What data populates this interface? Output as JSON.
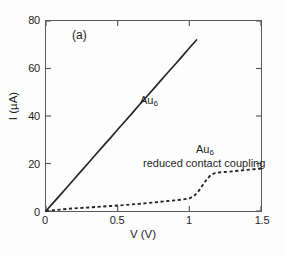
{
  "figure": {
    "panel_label": "(a)",
    "background_color": "#ffffff",
    "frame_color": "#5a5a5a"
  },
  "chart_data": {
    "type": "line",
    "title": "",
    "panel": "(a)",
    "xlabel": "V (V)",
    "ylabel": "I (µA)",
    "xlim": [
      0,
      1.5
    ],
    "ylim": [
      0,
      80
    ],
    "xticks": [
      0,
      0.5,
      1,
      1.5
    ],
    "xtick_labels": [
      "0",
      "0.5",
      "1",
      "1.5"
    ],
    "yticks": [
      0,
      20,
      40,
      60,
      80
    ],
    "ytick_labels": [
      "0",
      "20",
      "40",
      "60",
      "80"
    ],
    "grid": false,
    "tick_direction": "in",
    "legend": "none",
    "annotations": [
      {
        "text": "Au",
        "subscript": "6",
        "x": 0.73,
        "y": 47
      },
      {
        "text": "Au",
        "subscript": "6",
        "x": 1.11,
        "y": 27
      },
      {
        "text": "reduced contact coupling",
        "x": 0.95,
        "y": 22
      }
    ],
    "series": [
      {
        "name": "Au6",
        "label": "Au",
        "label_subscript": "6",
        "style": "solid",
        "color": "#262626",
        "x": [
          0.0,
          0.05,
          0.1,
          0.15,
          0.2,
          0.25,
          0.3,
          0.35,
          0.4,
          0.45,
          0.5,
          0.55,
          0.6,
          0.65,
          0.7,
          0.75,
          0.8,
          0.85,
          0.9,
          0.95,
          1.0,
          1.05
        ],
        "y": [
          0.0,
          3.4,
          6.8,
          10.2,
          13.7,
          17.1,
          20.5,
          24.0,
          27.4,
          30.8,
          34.3,
          37.7,
          41.1,
          44.6,
          48.0,
          51.4,
          54.9,
          58.3,
          61.7,
          65.1,
          68.6,
          72.0
        ]
      },
      {
        "name": "Au6 reduced contact coupling",
        "label": "Au",
        "label_subscript": "6",
        "sublabel": "reduced contact coupling",
        "style": "dashed",
        "color": "#262626",
        "x": [
          0.0,
          0.05,
          0.1,
          0.15,
          0.2,
          0.25,
          0.3,
          0.35,
          0.4,
          0.45,
          0.5,
          0.55,
          0.6,
          0.65,
          0.7,
          0.75,
          0.8,
          0.85,
          0.9,
          0.95,
          1.0,
          1.03,
          1.06,
          1.09,
          1.12,
          1.15,
          1.18,
          1.22,
          1.26,
          1.3,
          1.35,
          1.4,
          1.45,
          1.5
        ],
        "y": [
          0.0,
          0.3,
          0.6,
          0.9,
          1.1,
          1.3,
          1.5,
          1.7,
          1.9,
          2.1,
          2.3,
          2.5,
          2.8,
          3.0,
          3.3,
          3.6,
          3.9,
          4.2,
          4.5,
          4.8,
          5.3,
          6.2,
          8.0,
          10.6,
          13.2,
          15.2,
          16.0,
          16.3,
          16.5,
          16.7,
          17.0,
          17.3,
          17.6,
          17.9
        ]
      }
    ]
  }
}
